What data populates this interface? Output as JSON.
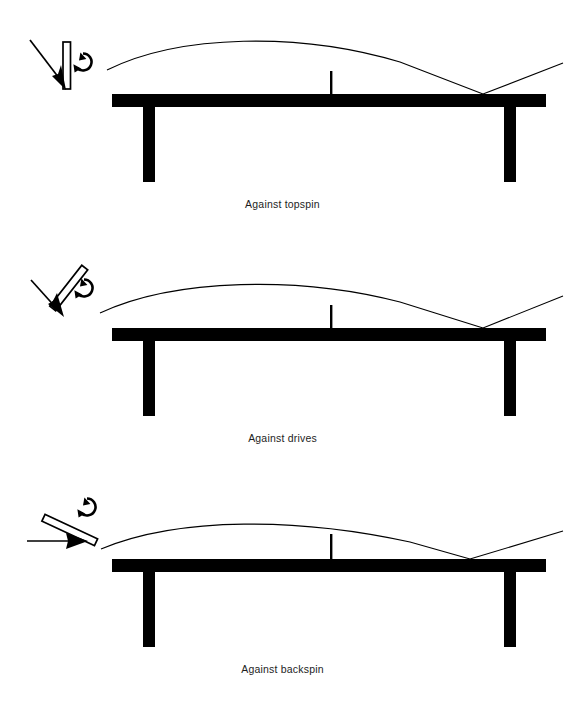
{
  "page": {
    "background_color": "#ffffff",
    "ink_color": "#000000",
    "width": 565,
    "height": 711
  },
  "diagrams": [
    {
      "id": "against-topspin",
      "caption": "Against topspin",
      "bat": {
        "name": "bat-vertical",
        "angle_label": "vertical",
        "incoming_arrow": "arrow-down-right",
        "spin_marker": "clockwise-spin-icon"
      },
      "trajectory": {
        "name": "ball-path-topspin",
        "bounce_point_label": "far-court bounce",
        "rebound": "high rising rebound"
      },
      "table": {
        "net_label": "net",
        "left_leg_label": "near leg",
        "right_leg_label": "far leg"
      }
    },
    {
      "id": "against-drives",
      "caption": "Against drives",
      "bat": {
        "name": "bat-tilted-forward",
        "angle_label": "tilted forward",
        "incoming_arrow": "arrow-down-right",
        "spin_marker": "clockwise-spin-icon"
      },
      "trajectory": {
        "name": "ball-path-drives",
        "bounce_point_label": "far-court bounce",
        "rebound": "medium rising rebound"
      },
      "table": {
        "net_label": "net",
        "left_leg_label": "near leg",
        "right_leg_label": "far leg"
      }
    },
    {
      "id": "against-backspin",
      "caption": "Against backspin",
      "bat": {
        "name": "bat-tilted-open",
        "angle_label": "open face",
        "incoming_arrow": "arrow-right",
        "spin_marker": "anticlockwise-spin-icon"
      },
      "trajectory": {
        "name": "ball-path-backspin",
        "bounce_point_label": "far-court bounce",
        "rebound": "low flat rebound"
      },
      "table": {
        "net_label": "net",
        "left_leg_label": "near leg",
        "right_leg_label": "far leg"
      }
    }
  ]
}
